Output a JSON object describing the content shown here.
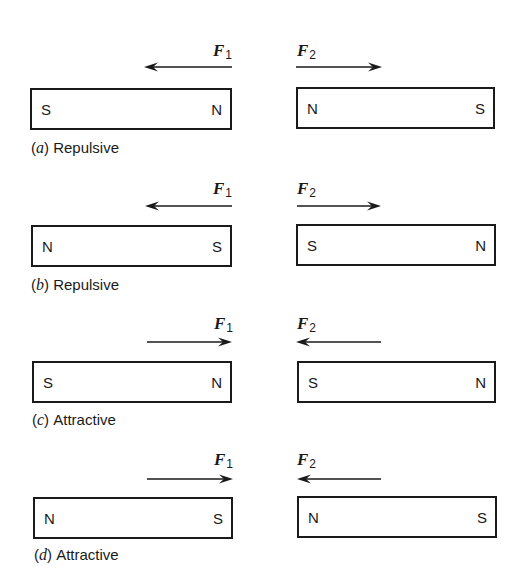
{
  "figure": {
    "panels": [
      {
        "id": "a",
        "top": 42,
        "caption_letter": "a",
        "caption_text": "Repulsive",
        "f1": {
          "label": "F",
          "sub": "1",
          "direction": "left"
        },
        "f2": {
          "label": "F",
          "sub": "2",
          "direction": "right"
        },
        "left_magnet": {
          "left_pole": "S",
          "right_pole": "N"
        },
        "right_magnet": {
          "left_pole": "N",
          "right_pole": "S"
        }
      },
      {
        "id": "b",
        "top": 180,
        "caption_letter": "b",
        "caption_text": "Repulsive",
        "f1": {
          "label": "F",
          "sub": "1",
          "direction": "left"
        },
        "f2": {
          "label": "F",
          "sub": "2",
          "direction": "right"
        },
        "left_magnet": {
          "left_pole": "N",
          "right_pole": "S"
        },
        "right_magnet": {
          "left_pole": "S",
          "right_pole": "N"
        }
      },
      {
        "id": "c",
        "top": 315,
        "caption_letter": "c",
        "caption_text": "Attractive",
        "f1": {
          "label": "F",
          "sub": "1",
          "direction": "right"
        },
        "f2": {
          "label": "F",
          "sub": "2",
          "direction": "left"
        },
        "left_magnet": {
          "left_pole": "S",
          "right_pole": "N"
        },
        "right_magnet": {
          "left_pole": "S",
          "right_pole": "N"
        }
      },
      {
        "id": "d",
        "top": 451,
        "caption_letter": "d",
        "caption_text": "Attractive",
        "f1": {
          "label": "F",
          "sub": "1",
          "direction": "right"
        },
        "f2": {
          "label": "F",
          "sub": "2",
          "direction": "left"
        },
        "left_magnet": {
          "left_pole": "N",
          "right_pole": "S"
        },
        "right_magnet": {
          "left_pole": "N",
          "right_pole": "S"
        }
      }
    ],
    "paren_open": "(",
    "paren_close": ")"
  }
}
